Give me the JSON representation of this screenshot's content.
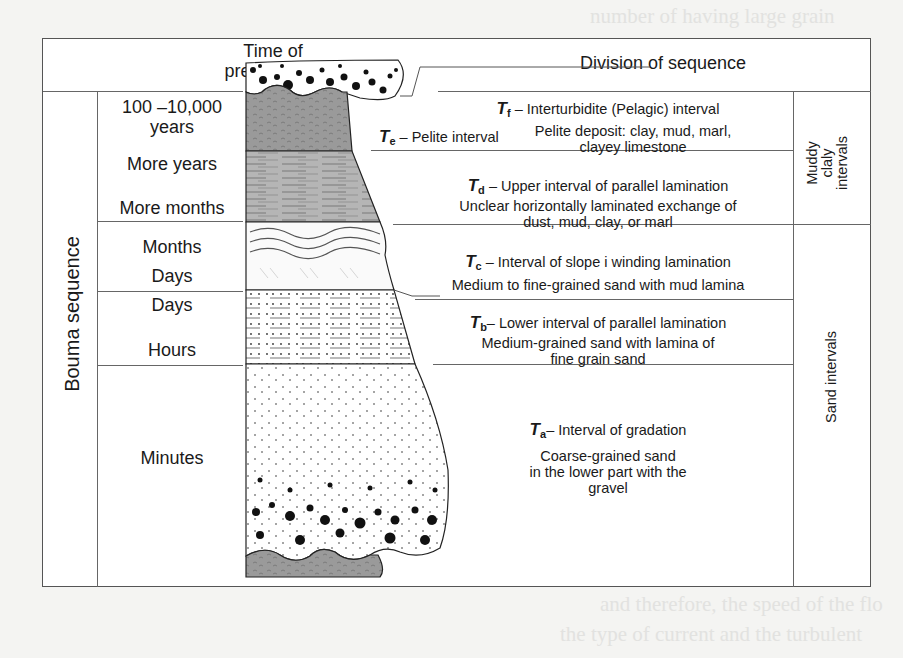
{
  "diagram": {
    "headers": {
      "time": "Time of precipitation",
      "time_line1": "Time of",
      "time_line2": "precipitation",
      "division": "Division of sequence"
    },
    "side_label": "Bouma sequence",
    "right_groups": [
      {
        "label_lines": [
          "Muddy",
          "claly",
          "intervals"
        ]
      },
      {
        "label": "Sand intervals"
      }
    ],
    "time_rows": [
      {
        "lines": [
          "100 –10,000",
          "years"
        ]
      },
      {
        "lines": [
          "More years"
        ]
      },
      {
        "lines": [
          "More months"
        ]
      },
      {
        "lines": [
          "Months",
          "Days"
        ]
      },
      {
        "lines": [
          "Days"
        ]
      },
      {
        "lines": [
          "Hours"
        ]
      },
      {
        "lines": [
          "Minutes"
        ]
      }
    ],
    "intervals": [
      {
        "symbol": "T",
        "sub": "f",
        "title": "– Interturbidite (Pelagic) interval",
        "desc": []
      },
      {
        "symbol": "T",
        "sub": "e",
        "title": "– Pelite interval",
        "desc": [
          "Pelite  deposit: clay, mud, marl,",
          "clayey limestone"
        ]
      },
      {
        "symbol": "T",
        "sub": "d",
        "title": "– Upper interval of parallel lamination",
        "desc": [
          "Unclear horizontally laminated exchange of",
          "dust, mud, clay, or marl"
        ]
      },
      {
        "symbol": "T",
        "sub": "c",
        "title": "– Interval of slope i winding lamination",
        "desc": [
          "Medium to fine-grained sand with mud lamina"
        ]
      },
      {
        "symbol": "T",
        "sub": "b",
        "title": "– Lower interval of parallel lamination",
        "desc": [
          "Medium-grained sand with lamina of",
          "fine grain sand"
        ]
      },
      {
        "symbol": "T",
        "sub": "a",
        "title": "– Interval of gradation",
        "desc": [
          "Coarse-grained sand",
          "in the lower part with the",
          "gravel"
        ]
      }
    ],
    "colors": {
      "frame": "#555555",
      "mud_fill": "#9a9a9a",
      "td_fill": "#b8b8b8",
      "gravel": "#111111",
      "background_page": "#f4f4f2"
    }
  },
  "background_text": [
    "number of having large grain",
    "and therefore, the speed of the flo",
    "the type of current and the turbulent",
    "mainly to the erosion of the underlying",
    "deposits in the form of thin sediments",
    "lamination and large blocks of",
    "the grains are no longer moved"
  ]
}
